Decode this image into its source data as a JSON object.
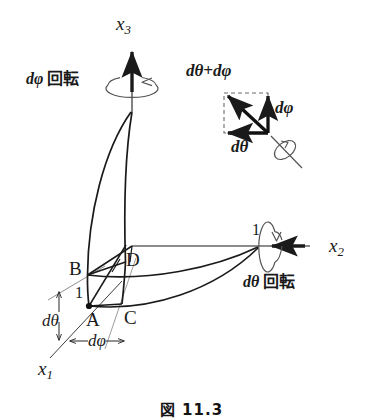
{
  "figure": {
    "title_alt": "Rotation composition diagram: dtheta about x2 and dphi about x3",
    "caption": "図 11.3",
    "background_color": "#ffffff",
    "ink_color": "#1a1a1a",
    "axes": [
      {
        "id": "x3",
        "label": "x",
        "subscript": "3",
        "direction": "up",
        "arrow": true
      },
      {
        "id": "x2",
        "label": "x",
        "subscript": "2",
        "direction": "left",
        "arrow": true
      },
      {
        "id": "x1",
        "label": "x",
        "subscript": "1",
        "direction": "down-left",
        "arrow": false
      }
    ],
    "points": [
      {
        "id": "A",
        "label": "A",
        "marked": true
      },
      {
        "id": "B",
        "label": "B",
        "marked": false
      },
      {
        "id": "C",
        "label": "C",
        "marked": false
      },
      {
        "id": "D",
        "label": "D",
        "marked": false
      }
    ],
    "unit_ticks": [
      {
        "id": "unit-x1",
        "label": "1",
        "axis": "x1"
      },
      {
        "id": "unit-x2",
        "label": "1",
        "axis": "x2"
      }
    ],
    "angle_markers": [
      {
        "id": "dtheta-marker",
        "label": "dθ",
        "orientation": "vertical"
      },
      {
        "id": "dphi-marker",
        "label": "dφ",
        "orientation": "horizontal"
      }
    ],
    "rotation_annotations": [
      {
        "id": "dphi-rotation",
        "label": "dφ 回転",
        "math": "dφ",
        "word": "回転",
        "about_axis": "x3"
      },
      {
        "id": "dtheta-rotation",
        "label": "dθ 回転",
        "math": "dθ",
        "word": "回転",
        "about_axis": "x2"
      }
    ],
    "vector_inset": {
      "id": "vector-sum-inset",
      "resultant_label": "dθ+dφ",
      "vertical_label": "dφ",
      "horizontal_label": "dθ",
      "box_style": "dashed",
      "resultant_direction": "up-left",
      "vertical_direction": "up",
      "horizontal_direction": "left",
      "axis_marker": "rotation-ellipse-with-axis-line"
    }
  }
}
